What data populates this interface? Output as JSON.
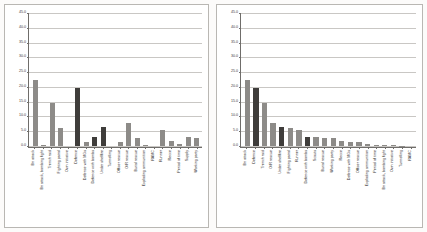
{
  "page": {
    "background": "#fcfbfa"
  },
  "colors": {
    "bar_light": "#8d8b88",
    "bar_dark": "#3f3d3b",
    "gridline": "#c9c7c4",
    "axis": "#6f6d6a",
    "panel_border": "#b9b7b3",
    "plot_background": "#ffffff"
  },
  "charts": [
    {
      "id": "chart-left",
      "name": "unsorted-bar-chart"
    },
    {
      "id": "chart-right",
      "name": "sorted-bar-chart"
    }
  ],
  "chart_data": [
    {
      "type": "bar",
      "title": "",
      "xlabel": "",
      "ylabel": "",
      "ylim": [
        0.0,
        45.0
      ],
      "ytick_labels": [
        "45.0",
        "40.0",
        "35.0",
        "30.0",
        "25.0",
        "20.0",
        "15.0",
        "10.0",
        "5.0",
        "0.0"
      ],
      "ytick_values": [
        45.0,
        40.0,
        35.0,
        30.0,
        25.0,
        20.0,
        15.0,
        10.0,
        5.0,
        0.0
      ],
      "grid": true,
      "legend": "none",
      "categories": [
        "Bn attack",
        "Bn attack, bombing fight",
        "Trench raid",
        "Fighting patrol",
        "Own initiative",
        "Defence",
        "Defence with MGs",
        "Defence with bombs",
        "Under shellfire",
        "Tunnelling",
        "Officer rescue",
        "O/R rescue",
        "Burial rescue",
        "Exploding ammunition",
        "RAMC",
        "Runner",
        "Recce",
        "Period of time",
        "Supply",
        "Working party"
      ],
      "values": [
        22.4,
        0.3,
        14.7,
        6.1,
        0.0,
        19.5,
        1.3,
        3.1,
        6.5,
        0.0,
        1.2,
        7.8,
        2.8,
        0.4,
        0.0,
        5.5,
        1.6,
        0.6,
        2.9,
        2.8
      ],
      "dark_indices": [
        5,
        7,
        8
      ]
    },
    {
      "type": "bar",
      "title": "",
      "xlabel": "",
      "ylabel": "",
      "ylim": [
        0.0,
        45.0
      ],
      "ytick_labels": [
        "45.0",
        "40.0",
        "35.0",
        "30.0",
        "25.0",
        "20.0",
        "15.0",
        "10.0",
        "5.0",
        "0.0"
      ],
      "ytick_values": [
        45.0,
        40.0,
        35.0,
        30.0,
        25.0,
        20.0,
        15.0,
        10.0,
        5.0,
        0.0
      ],
      "grid": true,
      "legend": "none",
      "categories": [
        "Bn attack",
        "Defence",
        "Trench raid",
        "O/R rescue",
        "Under shellfire",
        "Fighting patrol",
        "Runner",
        "Defence with bombs",
        "Scouts",
        "Burial rescue",
        "Working party",
        "Recce",
        "Defence with MGs",
        "Officer rescue",
        "Exploding ammunition",
        "Period of time",
        "Bn attack, bombing fight",
        "Own initiative",
        "Tunnelling",
        "RAMC"
      ],
      "values": [
        22.4,
        19.5,
        14.7,
        7.8,
        6.5,
        6.1,
        5.5,
        3.1,
        2.9,
        2.8,
        2.8,
        1.6,
        1.3,
        1.2,
        0.6,
        0.5,
        0.3,
        0.2,
        0.1,
        0.0
      ],
      "dark_indices": [
        1,
        4,
        7
      ]
    }
  ]
}
